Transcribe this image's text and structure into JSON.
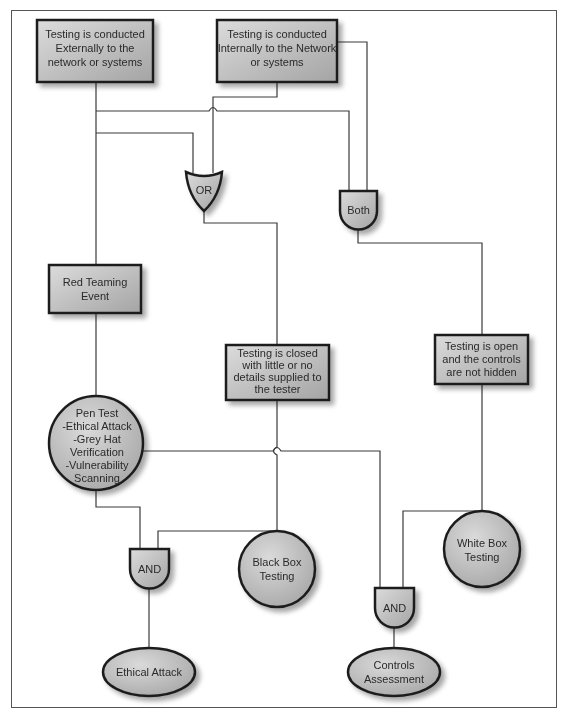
{
  "diagram": {
    "colors": {
      "frame": "#555555",
      "node_fill_light": "#d6d6d6",
      "node_fill_dark": "#a8a8a8",
      "node_border": "#1e1e1e",
      "connector": "#3a3a3a",
      "shadow": "#c8c8c8"
    },
    "boxes": {
      "external": [
        "Testing is conducted",
        "Externally to the",
        "network or systems"
      ],
      "internal": [
        "Testing is conducted",
        "Internally to the Network",
        "or systems"
      ],
      "red_team": [
        "Red Teaming",
        "Event"
      ],
      "closed": [
        "Testing is closed",
        "with little or no",
        "details supplied to",
        "the tester"
      ],
      "open": [
        "Testing is open",
        "and the controls",
        "are not hidden"
      ]
    },
    "gates": {
      "or": "OR",
      "both": "Both",
      "and_left": "AND",
      "and_right": "AND"
    },
    "circles": {
      "pen_test": [
        "Pen Test",
        "-Ethical Attack",
        "-Grey Hat",
        "Verification",
        "-Vulnerability",
        "Scanning"
      ],
      "black_box": [
        "Black Box",
        "Testing"
      ],
      "white_box": [
        "White Box",
        "Testing"
      ]
    },
    "ellipses": {
      "ethical_attack": [
        "Ethical Attack"
      ],
      "controls_assessment": [
        "Controls",
        "Assessment"
      ]
    }
  }
}
